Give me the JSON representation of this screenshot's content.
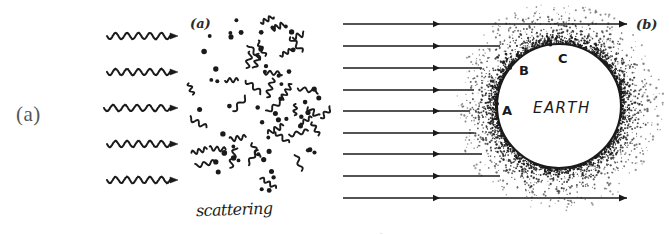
{
  "figure": {
    "background_color": "#ffffff",
    "ink_color": "#1a1a1a",
    "width": 669,
    "height": 235
  },
  "panel_a": {
    "outer_label": "(a)",
    "inner_label": "(a)",
    "caption": "scattering",
    "wave_arrow_count": 5,
    "wave_arrows": [
      {
        "y": 36,
        "x1": 107,
        "x2": 178
      },
      {
        "y": 72,
        "x1": 107,
        "x2": 178
      },
      {
        "y": 108,
        "x1": 104,
        "x2": 178
      },
      {
        "y": 144,
        "x1": 107,
        "x2": 178
      },
      {
        "y": 180,
        "x1": 107,
        "x2": 178
      }
    ],
    "scatter_region": {
      "x": 186,
      "y": 14,
      "width": 140,
      "height": 178
    },
    "dot_count": 52,
    "squiggle_count": 36
  },
  "panel_b": {
    "outer_label": "(b)",
    "body_label": "EARTH",
    "point_labels": [
      "A",
      "B",
      "C"
    ],
    "points": [
      {
        "label": "A",
        "x": 504,
        "y": 110
      },
      {
        "label": "B",
        "x": 521,
        "y": 70
      },
      {
        "label": "C",
        "x": 560,
        "y": 58
      }
    ],
    "ray_count": 9,
    "rays": [
      {
        "y": 24,
        "x1": 343,
        "x2": 627,
        "head_mid_x": 440
      },
      {
        "y": 46,
        "x1": 343,
        "x2": 500,
        "head_mid_x": 440
      },
      {
        "y": 68,
        "x1": 343,
        "x2": 482,
        "head_mid_x": 440
      },
      {
        "y": 90,
        "x1": 343,
        "x2": 474,
        "head_mid_x": 440
      },
      {
        "y": 111,
        "x1": 343,
        "x2": 470,
        "head_mid_x": 440
      },
      {
        "y": 133,
        "x1": 343,
        "x2": 474,
        "head_mid_x": 440
      },
      {
        "y": 154,
        "x1": 343,
        "x2": 482,
        "head_mid_x": 440
      },
      {
        "y": 176,
        "x1": 343,
        "x2": 500,
        "head_mid_x": 440
      },
      {
        "y": 198,
        "x1": 343,
        "x2": 627,
        "head_mid_x": 440
      }
    ],
    "earth_circle": {
      "cx": 559,
      "cy": 106,
      "r": 62
    },
    "atmosphere": {
      "cx": 559,
      "cy": 106,
      "inner_r": 63,
      "outer_r": 105,
      "stipple_count": 2600
    }
  },
  "bottom_edge_text": "."
}
